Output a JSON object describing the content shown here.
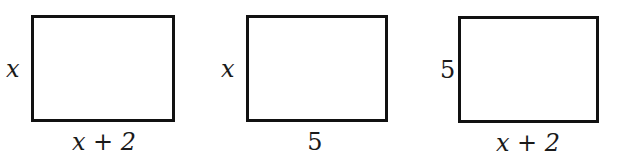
{
  "figure": {
    "rectangles": [
      {
        "side_label": "x",
        "bottom_label": "x + 2"
      },
      {
        "side_label": "x",
        "bottom_label": "5"
      },
      {
        "side_label": "5",
        "bottom_label": "x + 2"
      }
    ]
  }
}
